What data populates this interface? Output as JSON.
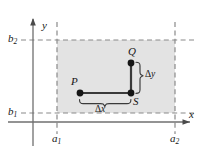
{
  "figure": {
    "name": "coordinate-plane-rectangle-path-diagram",
    "canvas": {
      "width": 205,
      "height": 154
    },
    "colors": {
      "background": "#ffffff",
      "region_fill": "#e3e3e3",
      "axis": "#6f6f6f",
      "dashed": "#8a8a8a",
      "path": "#3a3a3a",
      "dot": "#161616",
      "brace": "#3a3a3a",
      "text": "#161616"
    }
  },
  "axes": {
    "x_label": "x",
    "y_label": "y",
    "x_axis_y": 122,
    "y_axis_x": 33,
    "x_arrow": "right-arrowhead",
    "y_arrow": "up-arrowhead"
  },
  "ticks": {
    "x": [
      {
        "name": "a1",
        "label_main": "a",
        "label_sub": "1",
        "value": 57
      },
      {
        "name": "a2",
        "label_main": "a",
        "label_sub": "2",
        "value": 175
      }
    ],
    "y": [
      {
        "name": "b1",
        "label_main": "b",
        "label_sub": "1",
        "value": 113
      },
      {
        "name": "b2",
        "label_main": "b",
        "label_sub": "2",
        "value": 40
      }
    ]
  },
  "region": {
    "name": "shaded-rectangle",
    "left": 57,
    "right": 175,
    "top": 40,
    "bottom": 113
  },
  "points": [
    {
      "id": "P",
      "label": "P",
      "x": 80,
      "y": 93,
      "label_dx": -9,
      "label_dy": -15
    },
    {
      "id": "Q",
      "label": "Q",
      "x": 131,
      "y": 63,
      "label_dx": -3,
      "label_dy": -15
    },
    {
      "id": "S",
      "label": "S",
      "x": 131,
      "y": 93,
      "label_dx": 2,
      "label_dy": 4
    }
  ],
  "path": {
    "name": "P-to-S-to-Q-path",
    "segments": [
      {
        "from": "P",
        "to": "S",
        "orientation": "horizontal"
      },
      {
        "from": "S",
        "to": "Q",
        "orientation": "vertical"
      }
    ]
  },
  "annotations": [
    {
      "id": "dx",
      "name": "delta-x-brace",
      "symbol": "Δx",
      "greek": "Δ",
      "variable": "x",
      "orientation": "horizontal",
      "label_x": 98,
      "label_y": 108
    },
    {
      "id": "dy",
      "name": "delta-y-brace",
      "symbol": "Δy",
      "greek": "Δ",
      "variable": "y",
      "orientation": "vertical",
      "label_x": 147,
      "label_y": 74
    }
  ]
}
